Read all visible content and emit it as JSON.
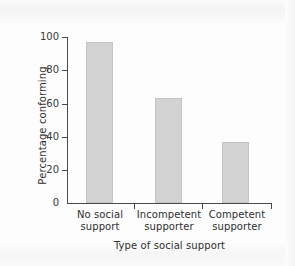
{
  "chart_data": {
    "type": "bar",
    "title": "",
    "xlabel": "Type of social support",
    "ylabel": "Percentage conforming",
    "categories": [
      "No social support",
      "Incompetent supporter",
      "Competent supporter"
    ],
    "category_lines": [
      [
        "No social",
        "support"
      ],
      [
        "Incompetent",
        "supporter"
      ],
      [
        "Competent",
        "supporter"
      ]
    ],
    "values": [
      97,
      63,
      36.5
    ],
    "ylim": [
      0,
      100
    ],
    "yticks": [
      0,
      20,
      40,
      60,
      80,
      100
    ],
    "ytick_labels": [
      "0",
      "20",
      "40",
      "60",
      "80",
      "100"
    ],
    "grid": false,
    "legend": null,
    "bar_color": "#d2d2d2",
    "axis_color": "#4a4a4a",
    "background": "#fdfdfd"
  }
}
